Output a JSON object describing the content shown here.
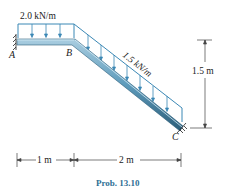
{
  "diagram": {
    "loads": {
      "horizontal": "2.0 kN/m",
      "inclined": "1.5 kN/m"
    },
    "points": {
      "a": "A",
      "b": "B",
      "c": "C"
    },
    "dimensions": {
      "horizontal_1": "1 m",
      "horizontal_2": "2 m",
      "vertical": "1.5 m"
    },
    "caption": "Prob. 13.10",
    "colors": {
      "beam": "#4f8fb0",
      "beam_dark": "#2c5e7a",
      "load": "#3b88b5",
      "caption": "#2f6f95"
    }
  }
}
